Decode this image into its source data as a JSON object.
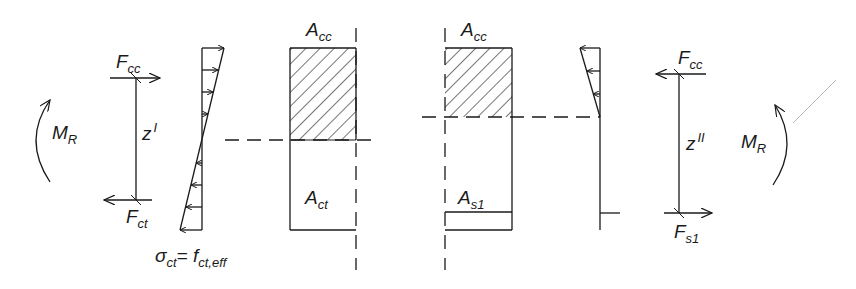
{
  "diagram": {
    "type": "reinforced concrete cross-section force equilibrium",
    "stroke_color": "#1a1a1a",
    "labels": {
      "moment_left": {
        "main": "M",
        "sub": "R"
      },
      "moment_right": {
        "main": "M",
        "sub": "R"
      },
      "fcc_left": {
        "main": "F",
        "sub": "cc"
      },
      "fct_left": {
        "main": "F",
        "sub": "ct"
      },
      "z_left": {
        "main": "z",
        "sup": "I"
      },
      "stress_label": {
        "sigma": "σ",
        "sigma_sub": "ct",
        "eq": "= f",
        "f_sub": "ct,eff"
      },
      "acc_left": {
        "main": "A",
        "sub": "cc"
      },
      "act_left": {
        "main": "A",
        "sub": "ct"
      },
      "acc_right": {
        "main": "A",
        "sub": "cc"
      },
      "as1_right": {
        "main": "A",
        "sub": "s1"
      },
      "fcc_right": {
        "main": "F",
        "sub": "cc"
      },
      "z_right": {
        "main": "z",
        "sup": "II"
      },
      "fs1_right": {
        "main": "F",
        "sub": "s1"
      }
    },
    "states": [
      {
        "name": "State I (uncracked)",
        "lever_arm": "z^I",
        "tension_force": "F_ct"
      },
      {
        "name": "State II (cracked)",
        "lever_arm": "z^II",
        "tension_force": "F_s1"
      }
    ]
  }
}
